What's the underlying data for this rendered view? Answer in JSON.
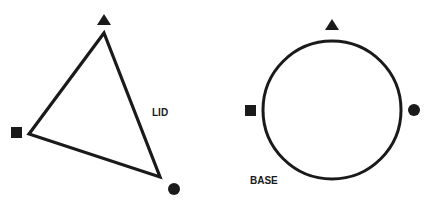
{
  "colors": {
    "stroke": "#1a1a1a",
    "background": "#ffffff"
  },
  "lid": {
    "label": "LID",
    "shape": "triangle",
    "markers": [
      "triangle-marker",
      "square-marker",
      "circle-marker"
    ]
  },
  "base": {
    "label": "BASE",
    "shape": "circle",
    "markers": [
      "triangle-marker",
      "square-marker",
      "circle-marker"
    ]
  }
}
